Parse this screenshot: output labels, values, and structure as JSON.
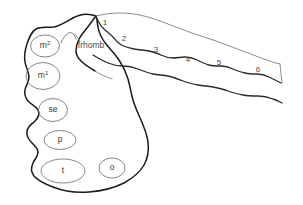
{
  "figure": {
    "background_color": "#ffffff",
    "outline_color": "#1a1a1a",
    "detail_color": "#787878",
    "width": 303,
    "height": 205
  },
  "region_labels": [
    {
      "id": "m2",
      "text": "m2",
      "base": "m",
      "superscript": "2",
      "x": 45,
      "y": 46
    },
    {
      "id": "m1",
      "text": "m1",
      "base": "m",
      "superscript": "1",
      "x": 43,
      "y": 76
    },
    {
      "id": "se",
      "text": "se",
      "base": "se",
      "superscript": "",
      "x": 53,
      "y": 110
    },
    {
      "id": "p",
      "text": "p",
      "base": "p",
      "superscript": "",
      "x": 60,
      "y": 140
    },
    {
      "id": "t",
      "text": "t",
      "base": "t",
      "superscript": "",
      "x": 63,
      "y": 171
    },
    {
      "id": "o",
      "text": "o",
      "base": "o",
      "superscript": "",
      "x": 112,
      "y": 168
    }
  ],
  "numbered_labels": [
    {
      "id": "n1",
      "text": "1",
      "x": 105,
      "y": 23
    },
    {
      "id": "n2",
      "text": "2",
      "x": 124,
      "y": 39
    },
    {
      "id": "n3",
      "text": "3",
      "x": 156,
      "y": 50
    },
    {
      "id": "n4",
      "text": "4",
      "x": 188,
      "y": 60
    },
    {
      "id": "n5",
      "text": "5",
      "x": 219,
      "y": 63
    },
    {
      "id": "n6",
      "text": "6",
      "x": 258,
      "y": 70
    }
  ],
  "named_labels": [
    {
      "id": "frhomb",
      "text": "frhomb",
      "x": 91,
      "y": 46
    }
  ]
}
